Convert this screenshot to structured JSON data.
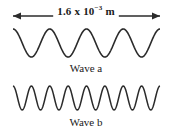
{
  "figure": {
    "background_color": "#ffffff",
    "stroke_color": "#2b2b2b",
    "width": 172,
    "height": 138
  },
  "dimension": {
    "mantissa": "1.6 x 10",
    "exponent": "−3",
    "unit": " m",
    "full_label": "1.6 x 10−3 m",
    "value": 0.0016,
    "units": "m",
    "arrow_left_x": 13,
    "arrow_right_x": 160,
    "arrow_y": 16
  },
  "waves": [
    {
      "id": "wave-a",
      "label": "Wave a",
      "cycles": 4,
      "amplitude_px": 14,
      "baseline_y": 43,
      "start_x": 13,
      "end_x": 160,
      "stroke_width": 1.6,
      "starts_at": "crest"
    },
    {
      "id": "wave-b",
      "label": "Wave b",
      "cycles": 8,
      "amplitude_px": 12,
      "baseline_y": 98,
      "start_x": 13,
      "end_x": 160,
      "stroke_width": 1.5,
      "starts_at": "crest"
    }
  ]
}
